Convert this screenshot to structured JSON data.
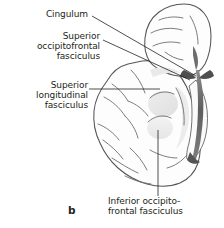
{
  "figure": {
    "panel_label": "b",
    "background_color": "#ffffff",
    "ink_color": "#231f20",
    "line_color": "#4a4a4a",
    "shade_light": "#efefef",
    "shade_mid": "#e2e2e2",
    "shade_dark": "#6a6a6a"
  },
  "labels": {
    "cingulum": "Cingulum",
    "superior_occipitofrontal_fasciculus": "Superior\noccipitofrontal\nfasciculus",
    "superior_longitudinal_fasciculus": "Superior\nlongitudinal\nfasciculus",
    "inferior_occipitofrontal_fasciculus": "Inferior occipito-\nfrontal fasciculus"
  },
  "leaders": [
    {
      "name": "cingulum-leader",
      "from": [
        92,
        16
      ],
      "to": [
        196,
        76
      ],
      "type": "diagonal"
    },
    {
      "name": "superior-occipitofrontal-leader",
      "from": [
        102,
        40
      ],
      "to": [
        190,
        80
      ],
      "type": "diagonal"
    },
    {
      "name": "superior-longitudinal-leader",
      "from": [
        89,
        89
      ],
      "to": [
        160,
        89
      ],
      "type": "horizontal"
    },
    {
      "name": "inferior-occipitofrontal-leader",
      "from": [
        158,
        130
      ],
      "to": [
        158,
        196
      ],
      "type": "vertical"
    }
  ]
}
